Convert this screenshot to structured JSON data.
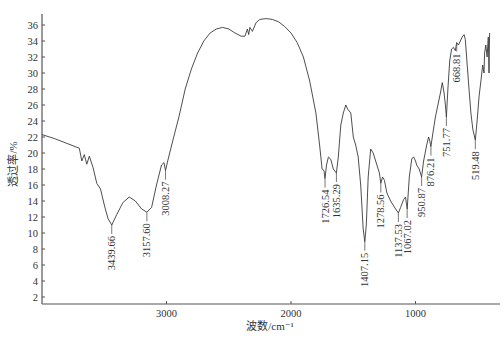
{
  "chart_data": {
    "type": "line",
    "title": "",
    "xlabel": "波数/cm⁻¹",
    "ylabel": "透过率/%",
    "xlim": [
      4000,
      400
    ],
    "ylim": [
      1,
      37
    ],
    "x_reversed": true,
    "grid": false,
    "legend": null,
    "x_ticks": [
      3000,
      2000,
      1000
    ],
    "y_ticks": [
      2,
      4,
      6,
      8,
      10,
      12,
      14,
      16,
      18,
      20,
      22,
      24,
      26,
      28,
      30,
      32,
      34,
      36
    ],
    "series": [
      {
        "name": "IR spectrum",
        "color": "#3a3a3a",
        "points": [
          [
            4000,
            22.3
          ],
          [
            3900,
            21.8
          ],
          [
            3800,
            21.2
          ],
          [
            3700,
            20.6
          ],
          [
            3680,
            19.0
          ],
          [
            3660,
            19.8
          ],
          [
            3640,
            18.6
          ],
          [
            3620,
            19.6
          ],
          [
            3590,
            18.2
          ],
          [
            3560,
            16.2
          ],
          [
            3530,
            15.5
          ],
          [
            3500,
            13.5
          ],
          [
            3470,
            11.8
          ],
          [
            3439.66,
            11.0
          ],
          [
            3400,
            12.3
          ],
          [
            3350,
            13.8
          ],
          [
            3300,
            14.5
          ],
          [
            3250,
            14.0
          ],
          [
            3200,
            13.0
          ],
          [
            3157.6,
            12.6
          ],
          [
            3120,
            13.2
          ],
          [
            3080,
            16.0
          ],
          [
            3040,
            18.5
          ],
          [
            3020,
            18.8
          ],
          [
            3008.27,
            17.8
          ],
          [
            2990,
            19.0
          ],
          [
            2950,
            21.5
          ],
          [
            2900,
            24.5
          ],
          [
            2850,
            28.0
          ],
          [
            2800,
            30.5
          ],
          [
            2750,
            32.5
          ],
          [
            2700,
            34.0
          ],
          [
            2650,
            35.0
          ],
          [
            2600,
            35.5
          ],
          [
            2550,
            35.7
          ],
          [
            2500,
            35.5
          ],
          [
            2450,
            35.0
          ],
          [
            2400,
            34.6
          ],
          [
            2370,
            34.6
          ],
          [
            2350,
            35.5
          ],
          [
            2340,
            34.8
          ],
          [
            2330,
            35.7
          ],
          [
            2310,
            35.2
          ],
          [
            2280,
            36.3
          ],
          [
            2250,
            36.7
          ],
          [
            2200,
            36.8
          ],
          [
            2150,
            36.7
          ],
          [
            2100,
            36.4
          ],
          [
            2050,
            35.8
          ],
          [
            2000,
            35.0
          ],
          [
            1950,
            33.8
          ],
          [
            1900,
            32.0
          ],
          [
            1850,
            29.0
          ],
          [
            1800,
            25.0
          ],
          [
            1770,
            21.0
          ],
          [
            1750,
            18.0
          ],
          [
            1735,
            17.8
          ],
          [
            1726.54,
            16.8
          ],
          [
            1715,
            18.5
          ],
          [
            1700,
            19.5
          ],
          [
            1680,
            19.2
          ],
          [
            1660,
            18.0
          ],
          [
            1635.29,
            17.5
          ],
          [
            1620,
            19.5
          ],
          [
            1600,
            23.5
          ],
          [
            1580,
            25.0
          ],
          [
            1560,
            26.0
          ],
          [
            1545,
            25.5
          ],
          [
            1520,
            25.0
          ],
          [
            1500,
            22.0
          ],
          [
            1480,
            21.0
          ],
          [
            1460,
            19.5
          ],
          [
            1440,
            16.0
          ],
          [
            1420,
            10.5
          ],
          [
            1407.15,
            8.9
          ],
          [
            1395,
            11.0
          ],
          [
            1380,
            17.0
          ],
          [
            1360,
            20.5
          ],
          [
            1340,
            20.0
          ],
          [
            1310,
            18.5
          ],
          [
            1290,
            17.5
          ],
          [
            1278.56,
            16.2
          ],
          [
            1265,
            17.0
          ],
          [
            1250,
            16.6
          ],
          [
            1230,
            15.0
          ],
          [
            1200,
            14.0
          ],
          [
            1160,
            13.0
          ],
          [
            1137.53,
            12.5
          ],
          [
            1120,
            13.2
          ],
          [
            1095,
            14.2
          ],
          [
            1080,
            14.5
          ],
          [
            1067.02,
            13.0
          ],
          [
            1050,
            17.0
          ],
          [
            1030,
            19.3
          ],
          [
            1015,
            19.5
          ],
          [
            1000,
            19.0
          ],
          [
            990,
            18.5
          ],
          [
            970,
            18.0
          ],
          [
            950.87,
            17.0
          ],
          [
            935,
            19.0
          ],
          [
            910,
            21.0
          ],
          [
            895,
            22.0
          ],
          [
            885,
            21.5
          ],
          [
            876.21,
            20.8
          ],
          [
            860,
            22.5
          ],
          [
            840,
            24.5
          ],
          [
            820,
            26.0
          ],
          [
            800,
            27.5
          ],
          [
            785,
            28.8
          ],
          [
            770,
            27.5
          ],
          [
            760,
            26.0
          ],
          [
            751.77,
            24.5
          ],
          [
            740,
            28.0
          ],
          [
            725,
            31.5
          ],
          [
            710,
            33.0
          ],
          [
            695,
            33.2
          ],
          [
            680,
            32.8
          ],
          [
            668.81,
            33.8
          ],
          [
            655,
            33.5
          ],
          [
            640,
            34.0
          ],
          [
            625,
            34.5
          ],
          [
            610,
            34.8
          ],
          [
            600,
            34.2
          ],
          [
            585,
            31.0
          ],
          [
            570,
            28.0
          ],
          [
            555,
            25.0
          ],
          [
            540,
            23.0
          ],
          [
            525,
            22.0
          ],
          [
            519.48,
            21.6
          ],
          [
            505,
            24.0
          ],
          [
            490,
            27.0
          ],
          [
            475,
            29.0
          ],
          [
            460,
            31.0
          ],
          [
            450,
            30.0
          ],
          [
            445,
            32.5
          ],
          [
            435,
            33.5
          ],
          [
            425,
            32.0
          ],
          [
            415,
            34.5
          ],
          [
            410,
            30.0
          ],
          [
            405,
            35.0
          ]
        ]
      }
    ],
    "annotations": [
      {
        "label": "3439.66",
        "x": 3439.66,
        "y": 11.0
      },
      {
        "label": "3157.60",
        "x": 3157.6,
        "y": 12.6
      },
      {
        "label": "3008.27",
        "x": 3008.27,
        "y": 17.8
      },
      {
        "label": "1726.54",
        "x": 1726.54,
        "y": 16.8
      },
      {
        "label": "1635.29",
        "x": 1635.29,
        "y": 17.5
      },
      {
        "label": "1407.15",
        "x": 1407.15,
        "y": 8.9
      },
      {
        "label": "1278.56",
        "x": 1278.56,
        "y": 16.2
      },
      {
        "label": "1137.53",
        "x": 1137.53,
        "y": 12.5
      },
      {
        "label": "1067.02",
        "x": 1067.02,
        "y": 13.0
      },
      {
        "label": "950.87",
        "x": 950.87,
        "y": 17.0
      },
      {
        "label": "876.21",
        "x": 876.21,
        "y": 20.8
      },
      {
        "label": "751.77",
        "x": 751.77,
        "y": 24.5
      },
      {
        "label": "668.81",
        "x": 668.81,
        "y": 33.8
      },
      {
        "label": "519.48",
        "x": 519.48,
        "y": 21.6
      }
    ]
  },
  "colors": {
    "axis": "#555555",
    "trace": "#3a3a3a",
    "text": "#333333",
    "background": "#ffffff"
  }
}
